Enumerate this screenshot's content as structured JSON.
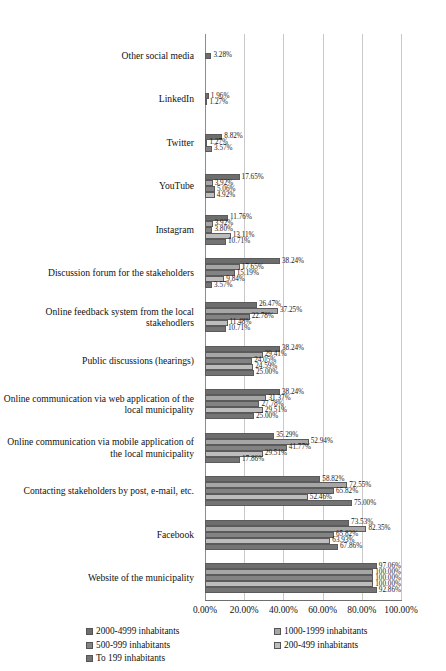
{
  "chart_data": {
    "type": "bar",
    "orientation": "horizontal",
    "title": "",
    "xlabel": "",
    "ylabel": "",
    "xlim": [
      0,
      100
    ],
    "grid": true,
    "legend_position": "bottom",
    "xticks": [
      "0.00%",
      "20.00%",
      "40.00%",
      "60.00%",
      "80.00%",
      "100.00%"
    ],
    "xtick_values": [
      0,
      20,
      40,
      60,
      80,
      100
    ],
    "categories": [
      "Other social media",
      "LinkedIn",
      "Twitter",
      "YouTube",
      "Instagram",
      "Discussion forum for the stakeholders",
      "Online feedback system from the local stakehodlers",
      "Public discussions (hearings)",
      "Online communication via web application of the local municipality",
      "Online communication via mobile application of the local municipality",
      "Contacting stakeholders by post, e-mail, etc.",
      "Facebook",
      "Website of the municipality"
    ],
    "series": [
      {
        "name": "2000-4999 inhabitants",
        "color": "#6d6d6d",
        "values": [
          3.28,
          1.96,
          8.82,
          17.65,
          11.76,
          38.24,
          26.47,
          38.24,
          38.24,
          35.29,
          58.82,
          73.53,
          97.06
        ],
        "labels": [
          "3.28%",
          "1.96%",
          "8.82%",
          "17.65%",
          "11.76%",
          "38.24%",
          "26.47%",
          "38.24%",
          "38.24%",
          "35.29%",
          "58.82%",
          "73.53%",
          "97.06%"
        ]
      },
      {
        "name": "1000-1999 inhabitants",
        "color": "#a6a6a6",
        "values": [
          null,
          1.27,
          1.27,
          3.92,
          3.92,
          17.65,
          37.25,
          29.41,
          31.37,
          52.94,
          72.55,
          82.35,
          100.0
        ],
        "labels": [
          null,
          "1.27%",
          "1.27%",
          "3.92%",
          "3.92%",
          "17.65%",
          "37.25%",
          "29.41%",
          "31.37%",
          "52.94%",
          "72.55%",
          "82.35%",
          "100.00%"
        ]
      },
      {
        "name": "500-999 inhabitants",
        "color": "#838383",
        "values": [
          null,
          null,
          3.57,
          5.06,
          3.8,
          15.19,
          22.78,
          24.05,
          27.78,
          41.77,
          65.82,
          65.82,
          100.0
        ],
        "labels": [
          null,
          null,
          "3.57%",
          "5.06%",
          "3.80%",
          "15.19%",
          "22.78%",
          "24.05%",
          "27.78%",
          "41.77%",
          "65.82%",
          "65.82%",
          "100.00%"
        ]
      },
      {
        "name": "200-499 inhabitants",
        "color": "#bdbdbd",
        "values": [
          null,
          null,
          null,
          4.92,
          13.11,
          9.84,
          11.48,
          24.59,
          29.51,
          29.51,
          52.46,
          63.93,
          100.0
        ],
        "labels": [
          null,
          null,
          null,
          "4.92%",
          "13.11%",
          "9.84%",
          "11.48%",
          "24.59%",
          "29.51%",
          "29.51%",
          "52.46%",
          "63.93%",
          "100.00%"
        ]
      },
      {
        "name": "To  199 inhabitants",
        "color": "#747474",
        "values": [
          null,
          null,
          null,
          null,
          10.71,
          3.57,
          10.71,
          25.0,
          25.0,
          17.86,
          75.0,
          67.86,
          92.86
        ],
        "labels": [
          null,
          null,
          null,
          null,
          "10.71%",
          "3.57%",
          "10.71%",
          "25.00%",
          "25.00%",
          "17.86%",
          "75.00%",
          "67.86%",
          "92.86%"
        ]
      }
    ]
  },
  "legend": {
    "items": [
      "2000-4999 inhabitants",
      "1000-1999 inhabitants",
      "500-999 inhabitants",
      "200-499 inhabitants",
      "To  199 inhabitants"
    ]
  }
}
